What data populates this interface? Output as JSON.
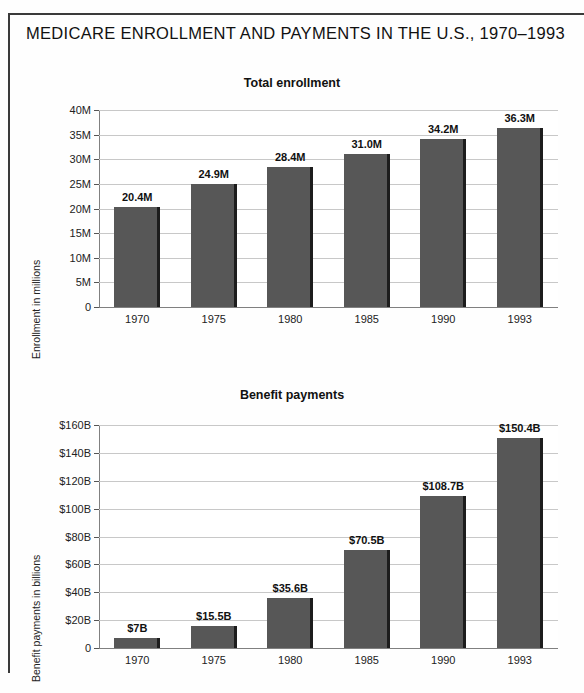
{
  "document": {
    "title": "MEDICARE ENROLLMENT AND PAYMENTS IN THE U.S., 1970–1993"
  },
  "chart_data": [
    {
      "type": "bar",
      "title": "Total enrollment",
      "xlabel": "",
      "ylabel": "Enrollment in millions",
      "categories": [
        "1970",
        "1975",
        "1980",
        "1985",
        "1990",
        "1993"
      ],
      "values": [
        20.4,
        24.9,
        28.4,
        31.0,
        34.2,
        36.3
      ],
      "data_labels": [
        "20.4M",
        "24.9M",
        "28.4M",
        "31.0M",
        "34.2M",
        "36.3M"
      ],
      "ylim": [
        0,
        40
      ],
      "yticks": [
        0,
        5,
        10,
        15,
        20,
        25,
        30,
        35,
        40
      ],
      "ytick_labels": [
        "0",
        "5M",
        "10M",
        "15M",
        "20M",
        "25M",
        "30M",
        "35M",
        "40M"
      ],
      "grid": true,
      "legend": "none",
      "bar_color": "#575757"
    },
    {
      "type": "bar",
      "title": "Benefit payments",
      "xlabel": "",
      "ylabel": "Benefit payments in billions",
      "categories": [
        "1970",
        "1975",
        "1980",
        "1985",
        "1990",
        "1993"
      ],
      "values": [
        7.0,
        15.5,
        35.6,
        70.5,
        108.7,
        150.4
      ],
      "data_labels": [
        "$7B",
        "$15.5B",
        "$35.6B",
        "$70.5B",
        "$108.7B",
        "$150.4B"
      ],
      "ylim": [
        0,
        160
      ],
      "yticks": [
        0,
        20,
        40,
        60,
        80,
        100,
        120,
        140,
        160
      ],
      "ytick_labels": [
        "0",
        "$20B",
        "$40B",
        "$60B",
        "$80B",
        "$100B",
        "$120B",
        "$140B",
        "$160B"
      ],
      "grid": true,
      "legend": "none",
      "bar_color": "#575757"
    }
  ]
}
